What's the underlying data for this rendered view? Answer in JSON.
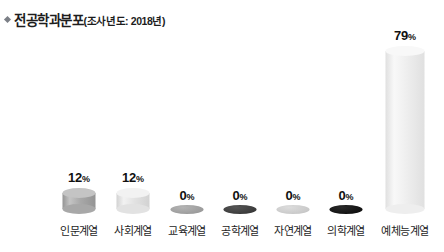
{
  "header": {
    "bullet_icon": "diamond-bullet-icon",
    "title_main": "전공학과분포",
    "title_sub": "(조사년도: 2018년)"
  },
  "chart_data": {
    "type": "bar",
    "xlabel": "",
    "ylabel": "",
    "ylim": [
      0,
      100
    ],
    "grid": false,
    "legend": "none",
    "unit": "%",
    "categories": [
      "인문계열",
      "사회계열",
      "교육계열",
      "공학계열",
      "자연계열",
      "의학계열",
      "예체능계열"
    ],
    "values": [
      12,
      12,
      0,
      0,
      0,
      0,
      79
    ],
    "value_labels": [
      "12",
      "12",
      "0",
      "0",
      "0",
      "0",
      "79"
    ],
    "bar_colors": [
      "#a8a8a8",
      "#e2e2e2",
      "#9c9c9c",
      "#3b3b3b",
      "#c9c9c9",
      "#121212",
      "#eeeeee"
    ],
    "bar_colors_light": [
      "#c4c4c4",
      "#f2f2f2",
      "#b4b4b4",
      "#555555",
      "#dcdcdc",
      "#2a2a2a",
      "#f8f8f8"
    ],
    "bar_colors_dark": [
      "#949494",
      "#d2d2d2",
      "#8a8a8a",
      "#2a2a2a",
      "#b8b8b8",
      "#000000",
      "#e0e0e0"
    ]
  }
}
